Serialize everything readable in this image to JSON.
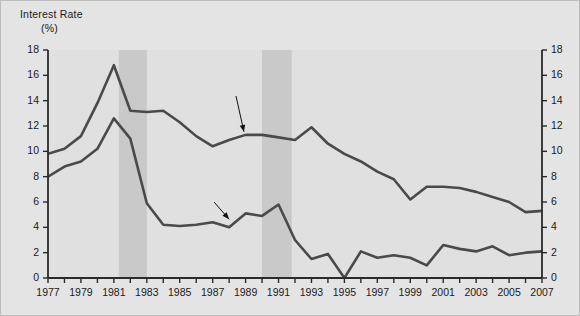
{
  "axes": {
    "y_title_line1": "Interest Rate",
    "y_title_line2": "(%)",
    "y_ticks": [
      "0",
      "2",
      "4",
      "6",
      "8",
      "10",
      "12",
      "14",
      "16",
      "18"
    ],
    "x_ticks": [
      "1977",
      "1979",
      "1981",
      "1983",
      "1985",
      "1987",
      "1989",
      "1991",
      "1993",
      "1995",
      "1997",
      "1999",
      "2001",
      "2003",
      "2005",
      "2007"
    ]
  },
  "labels": {
    "interest_rates": "Interest\nRates",
    "inflation": "Inflation"
  },
  "colors": {
    "background": "#e4e4e4",
    "plot_background": "#e0e0e0",
    "recession_band": "#c9c9c9",
    "line": "#4a4a4a",
    "axis": "#2a2a2a",
    "text": "#1a1a1a"
  },
  "chart_data": {
    "type": "line",
    "title": "",
    "xlabel": "",
    "ylabel": "Interest Rate (%)",
    "xlim": [
      1977,
      2007
    ],
    "ylim": [
      0,
      18
    ],
    "ytick_step": 2,
    "xtick_step": 1,
    "xtick_label_step": 2,
    "grid": false,
    "legend": "inline-annotations",
    "x": [
      1977,
      1978,
      1979,
      1980,
      1981,
      1982,
      1983,
      1984,
      1985,
      1986,
      1987,
      1988,
      1989,
      1990,
      1991,
      1992,
      1993,
      1994,
      1995,
      1996,
      1997,
      1998,
      1999,
      2000,
      2001,
      2002,
      2003,
      2004,
      2005,
      2006,
      2007
    ],
    "series": [
      {
        "name": "Interest Rates",
        "values": [
          9.8,
          10.2,
          11.2,
          13.8,
          16.8,
          13.2,
          13.1,
          13.2,
          12.3,
          11.2,
          10.4,
          10.9,
          11.3,
          11.3,
          11.1,
          10.9,
          11.9,
          10.6,
          9.8,
          9.2,
          8.4,
          7.8,
          6.2,
          7.2,
          7.2,
          7.1,
          6.8,
          6.4,
          6.0,
          5.2,
          5.3
        ]
      },
      {
        "name": "Inflation",
        "values": [
          8.0,
          8.8,
          9.2,
          10.2,
          12.6,
          11.0,
          5.9,
          4.2,
          4.1,
          4.2,
          4.4,
          4.0,
          5.1,
          4.9,
          5.8,
          3.0,
          1.5,
          1.9,
          0.0,
          2.1,
          1.6,
          1.8,
          1.6,
          1.0,
          2.6,
          2.3,
          2.1,
          2.5,
          1.8,
          2.0,
          2.1
        ]
      }
    ],
    "shaded_regions": [
      {
        "name": "recession-1",
        "start": 1981.3,
        "end": 1983.0
      },
      {
        "name": "recession-2",
        "start": 1990.0,
        "end": 1991.8
      }
    ],
    "annotations": [
      {
        "name": "interest-rates-annotation",
        "text": "Interest Rates",
        "points_to_x": 1988.9,
        "points_to_y": 11.3
      },
      {
        "name": "inflation-annotation",
        "text": "Inflation",
        "points_to_x": 1988.0,
        "points_to_y": 4.4
      }
    ]
  }
}
